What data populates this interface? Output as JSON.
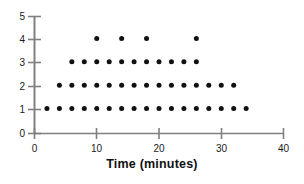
{
  "chart_data": {
    "type": "scatter",
    "title": "",
    "xlabel": "Time (minutes)",
    "ylabel": "",
    "xlim": [
      0,
      40
    ],
    "ylim": [
      0,
      5
    ],
    "xticks": [
      0,
      10,
      20,
      30,
      40
    ],
    "yticks": [
      0,
      1,
      2,
      3,
      4,
      5
    ],
    "xtick_labels": [
      "0",
      "10",
      "20",
      "30",
      "40"
    ],
    "ytick_labels": [
      "0",
      "1",
      "2",
      "3",
      "4",
      "5"
    ],
    "grid": false,
    "legend": null,
    "marker": "filled-circle",
    "marker_color": "#111111",
    "axis_color": "#808080",
    "points": [
      {
        "x": 2,
        "y": 1
      },
      {
        "x": 4,
        "y": 1
      },
      {
        "x": 6,
        "y": 1
      },
      {
        "x": 8,
        "y": 1
      },
      {
        "x": 10,
        "y": 1
      },
      {
        "x": 12,
        "y": 1
      },
      {
        "x": 14,
        "y": 1
      },
      {
        "x": 16,
        "y": 1
      },
      {
        "x": 18,
        "y": 1
      },
      {
        "x": 20,
        "y": 1
      },
      {
        "x": 22,
        "y": 1
      },
      {
        "x": 24,
        "y": 1
      },
      {
        "x": 26,
        "y": 1
      },
      {
        "x": 28,
        "y": 1
      },
      {
        "x": 30,
        "y": 1
      },
      {
        "x": 32,
        "y": 1
      },
      {
        "x": 34,
        "y": 1
      },
      {
        "x": 4,
        "y": 2
      },
      {
        "x": 6,
        "y": 2
      },
      {
        "x": 8,
        "y": 2
      },
      {
        "x": 10,
        "y": 2
      },
      {
        "x": 12,
        "y": 2
      },
      {
        "x": 14,
        "y": 2
      },
      {
        "x": 16,
        "y": 2
      },
      {
        "x": 18,
        "y": 2
      },
      {
        "x": 20,
        "y": 2
      },
      {
        "x": 22,
        "y": 2
      },
      {
        "x": 24,
        "y": 2
      },
      {
        "x": 26,
        "y": 2
      },
      {
        "x": 28,
        "y": 2
      },
      {
        "x": 30,
        "y": 2
      },
      {
        "x": 32,
        "y": 2
      },
      {
        "x": 6,
        "y": 3
      },
      {
        "x": 8,
        "y": 3
      },
      {
        "x": 10,
        "y": 3
      },
      {
        "x": 12,
        "y": 3
      },
      {
        "x": 14,
        "y": 3
      },
      {
        "x": 16,
        "y": 3
      },
      {
        "x": 18,
        "y": 3
      },
      {
        "x": 20,
        "y": 3
      },
      {
        "x": 22,
        "y": 3
      },
      {
        "x": 24,
        "y": 3
      },
      {
        "x": 26,
        "y": 3
      },
      {
        "x": 10,
        "y": 4
      },
      {
        "x": 14,
        "y": 4
      },
      {
        "x": 18,
        "y": 4
      },
      {
        "x": 26,
        "y": 4
      }
    ],
    "column_counts": [
      {
        "time": 2,
        "count": 1
      },
      {
        "time": 4,
        "count": 2
      },
      {
        "time": 6,
        "count": 3
      },
      {
        "time": 8,
        "count": 3
      },
      {
        "time": 10,
        "count": 4
      },
      {
        "time": 12,
        "count": 3
      },
      {
        "time": 14,
        "count": 4
      },
      {
        "time": 16,
        "count": 3
      },
      {
        "time": 18,
        "count": 4
      },
      {
        "time": 20,
        "count": 3
      },
      {
        "time": 22,
        "count": 3
      },
      {
        "time": 24,
        "count": 3
      },
      {
        "time": 26,
        "count": 4
      },
      {
        "time": 28,
        "count": 2
      },
      {
        "time": 30,
        "count": 2
      },
      {
        "time": 32,
        "count": 2
      },
      {
        "time": 34,
        "count": 1
      }
    ]
  }
}
